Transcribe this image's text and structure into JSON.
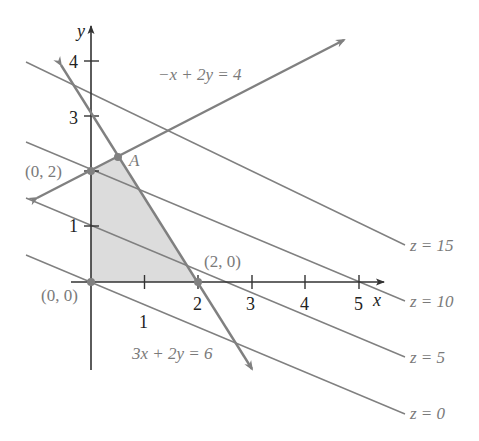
{
  "diagram": {
    "type": "linear-programming-feasible-region",
    "axes": {
      "x_label": "x",
      "y_label": "y",
      "x_ticks": [
        "1",
        "2",
        "3",
        "4",
        "5"
      ],
      "y_ticks": [
        "1",
        "3",
        "4"
      ]
    },
    "constraints": [
      {
        "label": "−x + 2y = 4"
      },
      {
        "label": "3x + 2y = 6"
      }
    ],
    "vertices": [
      {
        "label": "(0, 0)"
      },
      {
        "label": "(0, 2)"
      },
      {
        "label": "(2, 0)"
      },
      {
        "label": "A"
      }
    ],
    "level_lines": [
      {
        "label": "z = 15"
      },
      {
        "label": "z = 10"
      },
      {
        "label": "z = 5"
      },
      {
        "label": "z = 0"
      }
    ],
    "colors": {
      "region_fill": "#dcdcdc",
      "line_gray": "#808080",
      "axis": "#333333",
      "label_gray": "#7a7a7a"
    }
  }
}
